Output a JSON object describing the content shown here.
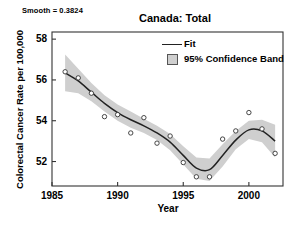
{
  "figure": {
    "title": "Canada: Total",
    "smooth_label": "Smooth = 0.3824",
    "xlabel": "Year",
    "ylabel": "Colorectal Cancer Rate per 100,000"
  },
  "legend": {
    "position": "top-right-inside",
    "items": [
      {
        "label": "Fit",
        "key": "line",
        "color": "#222222"
      },
      {
        "label": "95% Confidence Band",
        "key": "swatch",
        "color": "#cfcfcf"
      }
    ]
  },
  "chart_data": {
    "type": "line",
    "title": "Canada: Total",
    "subtitle": "Smooth = 0.3824",
    "xlabel": "Year",
    "ylabel": "Colorectal Cancer Rate per 100,000",
    "xlim": [
      1985,
      2002.6
    ],
    "ylim": [
      50.8,
      58.35
    ],
    "xticks": [
      1985,
      1990,
      1995,
      2000
    ],
    "yticks": [
      52,
      54,
      56,
      58
    ],
    "grid": false,
    "x": [
      1986,
      1987,
      1988,
      1989,
      1990,
      1991,
      1992,
      1993,
      1994,
      1995,
      1996,
      1997,
      1998,
      1999,
      2000,
      2001,
      2002
    ],
    "series": [
      {
        "name": "Observed",
        "type": "scatter",
        "marker": "open-circle",
        "values": [
          56.4,
          56.1,
          55.35,
          54.2,
          54.3,
          53.4,
          54.15,
          52.9,
          53.25,
          51.95,
          51.25,
          51.25,
          53.1,
          53.5,
          54.4,
          53.6,
          52.4
        ]
      },
      {
        "name": "Fit",
        "type": "line",
        "color": "#222222",
        "values": [
          56.35,
          55.95,
          55.4,
          54.85,
          54.4,
          54.05,
          53.75,
          53.4,
          52.95,
          52.3,
          51.68,
          51.6,
          52.3,
          53.05,
          53.55,
          53.5,
          53.0
        ]
      },
      {
        "name": "95% Confidence Band Upper",
        "type": "band-upper",
        "color": "#cfcfcf",
        "values": [
          57.25,
          56.55,
          55.85,
          55.25,
          54.8,
          54.45,
          54.1,
          53.75,
          53.35,
          52.75,
          52.2,
          52.15,
          52.85,
          53.5,
          54.0,
          54.05,
          53.8
        ]
      },
      {
        "name": "95% Confidence Band Lower",
        "type": "band-lower",
        "color": "#cfcfcf",
        "values": [
          55.45,
          55.35,
          54.95,
          54.45,
          54.0,
          53.65,
          53.4,
          53.05,
          52.55,
          51.85,
          51.16,
          51.05,
          51.75,
          52.6,
          53.1,
          52.95,
          52.2
        ]
      }
    ]
  }
}
